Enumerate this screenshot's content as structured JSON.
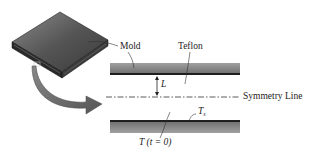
{
  "diagram": {
    "labels": {
      "mold": "Mold",
      "teflon": "Teflon",
      "length": "L",
      "symmetry_line": "Symmetry Line",
      "surface_temp_main": "T",
      "surface_temp_sub": "s",
      "initial_temp": "T (t = 0)"
    },
    "colors": {
      "strip_fill": "#7a7a7a",
      "strip_edge": "#1e1e1e",
      "mold_top": "#5c5c5c",
      "arrow_fill": "#6a6a6a",
      "line_color": "#333333"
    }
  }
}
